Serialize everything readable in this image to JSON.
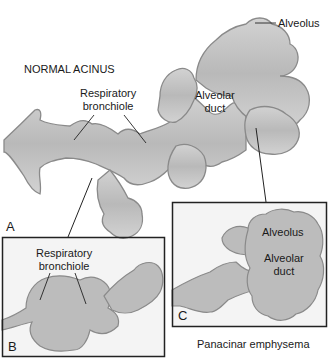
{
  "figure": {
    "panel_a": {
      "letter": "A",
      "title": "NORMAL ACINUS",
      "labels": {
        "respiratory_bronchiole_line1": "Respiratory",
        "respiratory_bronchiole_line2": "bronchiole",
        "alveolar_duct_line1": "Alveolar",
        "alveolar_duct_line2": "duct",
        "alveolus": "Alveolus"
      }
    },
    "panel_b": {
      "letter": "B",
      "labels": {
        "respiratory_bronchiole_line1": "Respiratory",
        "respiratory_bronchiole_line2": "bronchiole"
      }
    },
    "panel_c": {
      "letter": "C",
      "caption": "Panacinar emphysema",
      "labels": {
        "alveolus": "Alveolus",
        "alveolar_duct_line1": "Alveolar",
        "alveolar_duct_line2": "duct"
      }
    },
    "colors": {
      "tissue_fill": "#c4c4c4",
      "tissue_edge": "#8a8a8a",
      "panel_fill": "#f3f3f3",
      "line": "#222222"
    }
  }
}
